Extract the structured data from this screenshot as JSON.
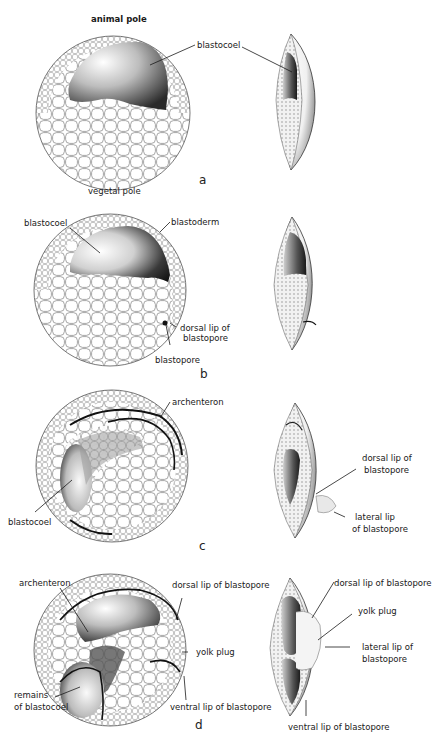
{
  "figure": {
    "stages": [
      {
        "id": "a",
        "letter": "a",
        "labels": {
          "animal_pole": "animal pole",
          "vegetal_pole": "vegetal pole",
          "blastocoel": "blastocoel"
        }
      },
      {
        "id": "b",
        "letter": "b",
        "labels": {
          "blastocoel": "blastocoel",
          "blastoderm": "blastoderm",
          "dorsal_lip_1": "dorsal lip of",
          "dorsal_lip_2": "blastopore",
          "blastopore": "blastopore"
        }
      },
      {
        "id": "c",
        "letter": "c",
        "labels": {
          "archenteron": "archenteron",
          "blastocoel": "blastocoel",
          "dorsal_lip_1": "dorsal lip of",
          "dorsal_lip_2": "blastopore",
          "lateral_lip_1": "lateral lip",
          "lateral_lip_2": "of blastopore"
        }
      },
      {
        "id": "d",
        "letter": "d",
        "labels": {
          "archenteron": "archenteron",
          "remains_1": "remains",
          "remains_2": "of blastocoel",
          "dorsal_lip": "dorsal lip of blastopore",
          "yolk_plug": "yolk plug",
          "ventral_lip": "ventral lip of blastopore",
          "r_dorsal_lip": "dorsal lip of blastopore",
          "r_yolk_plug": "yolk plug",
          "r_lateral_lip_1": "lateral lip of",
          "r_lateral_lip_2": "blastopore",
          "r_ventral_lip": "ventral lip of blastopore"
        }
      }
    ],
    "colors": {
      "ink": "#1a1a1a",
      "cell_stroke": "#6b6b6b",
      "background": "#ffffff"
    }
  }
}
